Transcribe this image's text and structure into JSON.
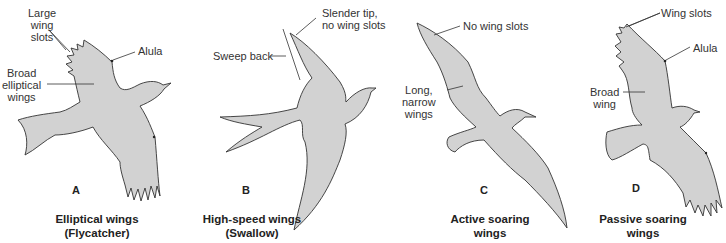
{
  "colors": {
    "background": "#ffffff",
    "bird_fill": "#d2d2d2",
    "outline": "#333333",
    "text": "#222222"
  },
  "panels": [
    {
      "letter": "A",
      "caption_line1": "Elliptical wings",
      "caption_line2": "(Flycatcher)",
      "labels": {
        "wing_slots_1": "Large",
        "wing_slots_2": "wing",
        "wing_slots_3": "slots",
        "alula": "Alula",
        "broad_1": "Broad",
        "broad_2": "elliptical",
        "broad_3": "wings"
      }
    },
    {
      "letter": "B",
      "caption_line1": "High-speed wings",
      "caption_line2": "(Swallow)",
      "labels": {
        "tip_1": "Slender tip,",
        "tip_2": "no wing slots",
        "sweep": "Sweep back"
      }
    },
    {
      "letter": "C",
      "caption_line1": "Active soaring",
      "caption_line2": "wings",
      "labels": {
        "no_slots": "No wing slots",
        "long_1": "Long,",
        "long_2": "narrow",
        "long_3": "wings"
      }
    },
    {
      "letter": "D",
      "caption_line1": "Passive soaring",
      "caption_line2": "wings",
      "labels": {
        "wing_slots": "Wing slots",
        "alula": "Alula",
        "broad_1": "Broad",
        "broad_2": "wing"
      }
    }
  ]
}
